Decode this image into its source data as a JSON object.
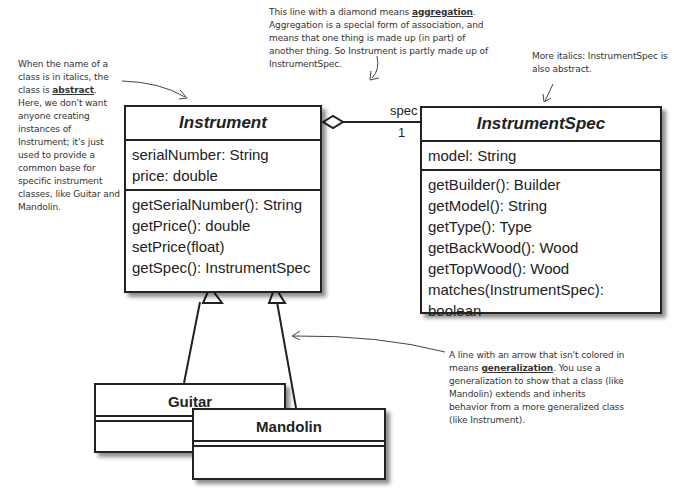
{
  "notes": {
    "abstract": {
      "before": "When the name of a class is in italics, the class is ",
      "keyword": "abstract",
      "after": ". Here, we don't want anyone creating instances of Instrument; it's just used to provide a common base for specific instrument classes, like Guitar and Mandolin."
    },
    "aggregation": {
      "before": "This line with a diamond means ",
      "keyword": "aggregation",
      "after": ". Aggregation is a special form of association, and means that one thing is made up (in part) of another thing. So Instrument is partly made up of InstrumentSpec."
    },
    "more_italics": "More italics: InstrumentSpec is also abstract.",
    "generalization": {
      "before": "A line with an arrow that isn't colored in means ",
      "keyword": "generalization",
      "after": ". You use a generalization to show that a class (like Mandolin) extends and inherits behavior from a more generalized class (like Instrument)."
    }
  },
  "classes": {
    "instrument": {
      "name": "Instrument",
      "attributes": [
        "serialNumber: String",
        "price: double"
      ],
      "methods": [
        "getSerialNumber(): String",
        "getPrice(): double",
        "setPrice(float)",
        "getSpec(): InstrumentSpec"
      ]
    },
    "instrument_spec": {
      "name": "InstrumentSpec",
      "attributes": [
        "model: String"
      ],
      "methods": [
        "getBuilder(): Builder",
        "getModel(): String",
        "getType(): Type",
        "getBackWood(): Wood",
        "getTopWood(): Wood",
        "matches(InstrumentSpec): boolean"
      ]
    },
    "guitar": {
      "name": "Guitar"
    },
    "mandolin": {
      "name": "Mandolin"
    }
  },
  "association": {
    "role": "spec",
    "multiplicity": "1"
  }
}
